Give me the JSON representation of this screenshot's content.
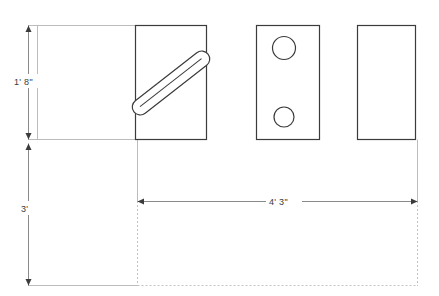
{
  "drawing": {
    "title": "Elevation layout with dimensions",
    "background_color": "#ffffff",
    "line_color_dark": "#3b3b3b",
    "line_color_light": "#b9b9b9",
    "dimension_color": "#8a8a8a",
    "text_color": "#3a3a3a",
    "dashed_color": "#bdbdbd"
  },
  "dimensions": {
    "vertical_upper": {
      "label": "1' 8\"",
      "name": "height-upper"
    },
    "vertical_lower": {
      "label": "3'",
      "name": "depth-lower"
    },
    "horizontal": {
      "label": "4' 3\"",
      "name": "width-overall"
    }
  },
  "panels": [
    {
      "name": "panel-blank-left",
      "style": "light-outline",
      "features": []
    },
    {
      "name": "panel-with-diagonal-handle",
      "style": "dark-outline",
      "features": [
        "diagonal-handle"
      ]
    },
    {
      "name": "panel-with-two-holes",
      "style": "dark-outline",
      "features": [
        "hole-upper",
        "hole-lower"
      ]
    },
    {
      "name": "panel-blank-right",
      "style": "dark-outline",
      "features": []
    }
  ],
  "footprint": {
    "name": "floor-footprint",
    "style": "dashed-outline"
  }
}
